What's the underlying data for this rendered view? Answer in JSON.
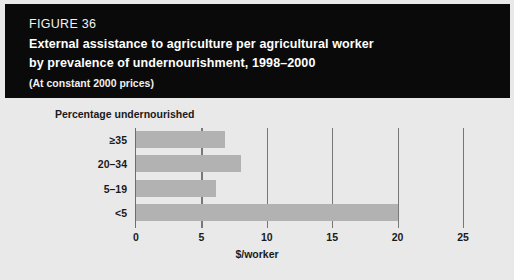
{
  "header": {
    "figure_number": "FIGURE 36",
    "title_line1": "External assistance to agriculture per agricultural worker",
    "title_line2": "by prevalence of undernourishment, 1998–2000",
    "subtitle": "(At constant 2000 prices)"
  },
  "colors": {
    "header_background": "#0a0a0a",
    "header_text": "#ffffff",
    "panel_background": "#e9e9e9",
    "bar_fill": "#b2b2b2",
    "axis_line": "#6e6e6e",
    "gridline": "#777777",
    "label_text": "#1a1a1a"
  },
  "chart_data": {
    "type": "bar",
    "orientation": "horizontal",
    "title": "External assistance to agriculture per agricultural worker by prevalence of undernourishment, 1998–2000",
    "subtitle": "(At constant 2000 prices)",
    "ylabel": "Percentage undernourished",
    "xlabel": "$/worker",
    "categories": [
      "≥35",
      "20–34",
      "5–19",
      "<5"
    ],
    "values": [
      6.8,
      8.0,
      6.1,
      20.0
    ],
    "xlim": [
      0,
      25
    ],
    "xticks": [
      0,
      5,
      10,
      15,
      20,
      25
    ],
    "xtick_labels": [
      "0",
      "5",
      "10",
      "15",
      "20",
      "25"
    ],
    "grid": "vertical-only",
    "legend": "none"
  }
}
